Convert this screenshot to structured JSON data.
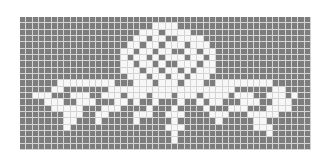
{
  "pattern": {
    "title": "",
    "columns": 46,
    "rows": 21,
    "colors": {
      "filled": "#7d7d7d",
      "open": "#f7f7f7",
      "gridline": "#d4d4d4"
    },
    "legend": "1 = open (white) square, 0 = filled (gray) square",
    "grid": [
      "0000000000000000000000000000000000000000000000",
      "0000000000000000000001111000000000000000000000",
      "0000000000000000000111011110000000000000000000",
      "0000000000000000001101100111100000000000000000",
      "0000000000000000011011011101110000000000000000",
      "0000000000000000110110110011011000000000000000",
      "0000000000000000101101011101101000000000000000",
      "0000000000000000110110100111011000000000000000",
      "0000000000000000111011011010111000000000000000",
      "0000000000000000011101101101110000000000000000",
      "0000001111111110001110111011100111111111000000",
      "0000011000000011111111111111111111000000110000",
      "0011100011100111011101110111011110111001110100",
      "0000111001110001101001000100101100011100111000",
      "0000011111000111000010001000010001110001111000",
      "0000000111001100001110011100001110001111100000",
      "0000000110001000001000001000000100000110000000",
      "0000000100000000000000011100000000000111000000",
      "0000000000000000000000001000000000000001000000",
      "0000000000000000000000001000000000000000000000",
      "0000000000000000000000000000000000000000000000"
    ]
  }
}
